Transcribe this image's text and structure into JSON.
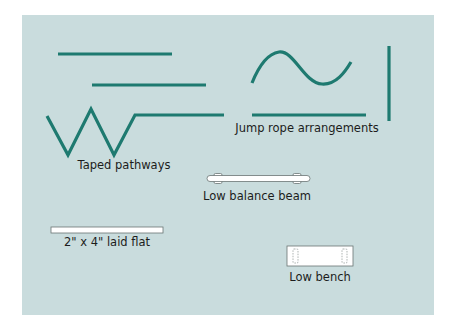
{
  "diagram": {
    "colors": {
      "background": "#ffffff",
      "panel": "#c9dcdd",
      "tape": "#1e7a70",
      "board_fill": "#ffffff",
      "board_stroke": "#6a7473",
      "label": "#1c1c1c"
    },
    "groups": [
      {
        "id": "taped-pathways",
        "label": "Taped pathways",
        "elements": [
          "straight tape line",
          "offset straight tape line",
          "zigzag tape path ending in straight line"
        ]
      },
      {
        "id": "jump-rope-arrangements",
        "label": "Jump rope arrangements",
        "elements": [
          "wavy rope",
          "horizontal rope",
          "vertical rope"
        ]
      },
      {
        "id": "low-balance-beam",
        "label": "Low balance beam",
        "elements": [
          "beam with two supports (top view)"
        ]
      },
      {
        "id": "two-by-four",
        "label": "2\" x 4\" laid flat",
        "elements": [
          "flat board"
        ]
      },
      {
        "id": "low-bench",
        "label": "Low bench",
        "elements": [
          "bench with dashed legs (top view)"
        ]
      }
    ]
  }
}
